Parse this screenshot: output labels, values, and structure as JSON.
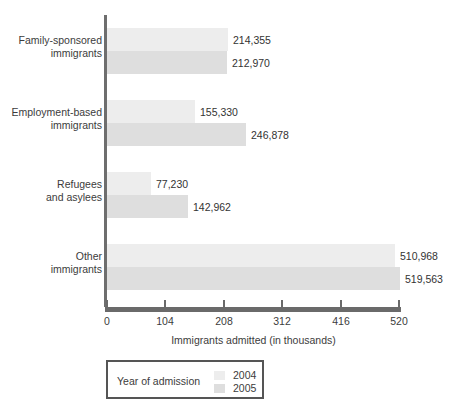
{
  "chart_data": {
    "type": "bar",
    "orientation": "horizontal",
    "title": "",
    "xlabel": "Immigrants admitted (in thousands)",
    "ylabel": "",
    "xlim": [
      0,
      520
    ],
    "xticks": [
      0,
      104,
      208,
      312,
      416,
      520
    ],
    "xtick_labels": [
      "0",
      "104",
      "208",
      "312",
      "416",
      "520"
    ],
    "grid": false,
    "categories": [
      "Family-sponsored\nimmigrants",
      "Employment-based\nimmigrants",
      "Refugees\nand asylees",
      "Other\nimmigrants"
    ],
    "series": [
      {
        "name": "2004",
        "color": "#ededed",
        "values": [
          214355,
          155330,
          77230,
          510968
        ],
        "value_labels": [
          "214,355",
          "155,330",
          "77,230",
          "510,968"
        ]
      },
      {
        "name": "2005",
        "color": "#dedede",
        "values": [
          212970,
          246878,
          142962,
          519563
        ],
        "value_labels": [
          "212,970",
          "246,878",
          "142,962",
          "519,563"
        ]
      }
    ],
    "legend": {
      "title": "Year of admission",
      "position": "below-axis",
      "entries": [
        {
          "label": "2004",
          "color": "#ededed"
        },
        {
          "label": "2005",
          "color": "#dedede"
        }
      ]
    }
  },
  "categories": [
    {
      "line1": "Family-sponsored",
      "line2": "immigrants"
    },
    {
      "line1": "Employment-based",
      "line2": "immigrants"
    },
    {
      "line1": "Refugees",
      "line2": "and asylees"
    },
    {
      "line1": "Other",
      "line2": "immigrants"
    }
  ],
  "axis": {
    "title": "Immigrants admitted (in thousands)",
    "ticks": [
      "0",
      "104",
      "208",
      "312",
      "416",
      "520"
    ]
  },
  "legend": {
    "title": "Year of admission",
    "item_2004": "2004",
    "item_2005": "2005"
  },
  "values": {
    "g0_2004": "214,355",
    "g0_2005": "212,970",
    "g1_2004": "155,330",
    "g1_2005": "246,878",
    "g2_2004": "77,230",
    "g2_2005": "142,962",
    "g3_2004": "510,968",
    "g3_2005": "519,563"
  },
  "colors": {
    "bar_2004": "#ededed",
    "bar_2005": "#dedede",
    "axis": "#6a6a6a",
    "text": "#3c3c3c"
  }
}
